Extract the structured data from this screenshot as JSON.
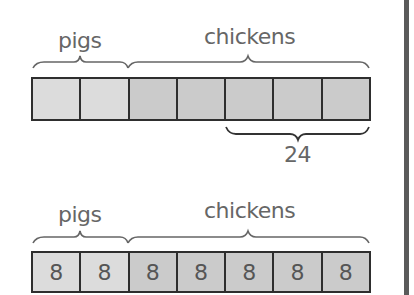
{
  "diagram_top": {
    "labels": {
      "pigs": "pigs",
      "chickens": "chickens"
    },
    "cells": [
      {
        "kind": "pig",
        "value": ""
      },
      {
        "kind": "pig",
        "value": ""
      },
      {
        "kind": "chicken",
        "value": ""
      },
      {
        "kind": "chicken",
        "value": ""
      },
      {
        "kind": "chicken",
        "value": ""
      },
      {
        "kind": "chicken",
        "value": ""
      },
      {
        "kind": "chicken",
        "value": ""
      }
    ],
    "bottom_brace_label": "24"
  },
  "diagram_bottom": {
    "labels": {
      "pigs": "pigs",
      "chickens": "chickens"
    },
    "cells": [
      {
        "kind": "pig",
        "value": "8"
      },
      {
        "kind": "pig",
        "value": "8"
      },
      {
        "kind": "chicken",
        "value": "8"
      },
      {
        "kind": "chicken",
        "value": "8"
      },
      {
        "kind": "chicken",
        "value": "8"
      },
      {
        "kind": "chicken",
        "value": "8"
      },
      {
        "kind": "chicken",
        "value": "8"
      }
    ]
  },
  "colors": {
    "pig_fill": "#dcdcdc",
    "chicken_fill": "#cbcbcb",
    "outline": "#2e2e2e",
    "text": "#666666"
  }
}
